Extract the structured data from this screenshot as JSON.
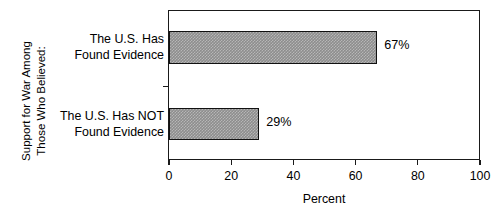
{
  "chart_data": {
    "type": "bar",
    "orientation": "horizontal",
    "title": "",
    "subtitle": "",
    "categories": [
      "The U.S. Has Found Evidence",
      "The U.S. Has NOT Found Evidence"
    ],
    "category_lines": [
      [
        "The U.S. Has",
        "Found Evidence"
      ],
      [
        "The U.S. Has NOT",
        "Found Evidence"
      ]
    ],
    "values": [
      67,
      29
    ],
    "value_labels": [
      "67%",
      "29%"
    ],
    "xlabel": "Percent",
    "ylabel": "Support for War Among Those Who Believed:",
    "ylabel_lines": [
      "Support for War Among",
      "Those Who Believed:"
    ],
    "xlim": [
      0,
      100
    ],
    "xticks": [
      0,
      20,
      40,
      60,
      80,
      100
    ],
    "xtick_labels": [
      "0",
      "20",
      "40",
      "60",
      "80",
      "100"
    ],
    "grid": false,
    "legend": false,
    "bar_fill_color": "#8d8d8d",
    "bar_edge_color": "#111111",
    "frame_color": "#1a1a1a",
    "background_color": "#ffffff"
  },
  "axes": {
    "x_title": "Percent",
    "y_title_line_1": "Support for War Among",
    "y_title_line_2": "Those Who Believed:"
  },
  "bars": [
    {
      "label_line_1": "The U.S. Has",
      "label_line_2": "Found Evidence",
      "value": 67,
      "value_label": "67%"
    },
    {
      "label_line_1": "The U.S. Has NOT",
      "label_line_2": "Found Evidence",
      "value": 29,
      "value_label": "29%"
    }
  ],
  "xtick_labels": [
    "0",
    "20",
    "40",
    "60",
    "80",
    "100"
  ]
}
